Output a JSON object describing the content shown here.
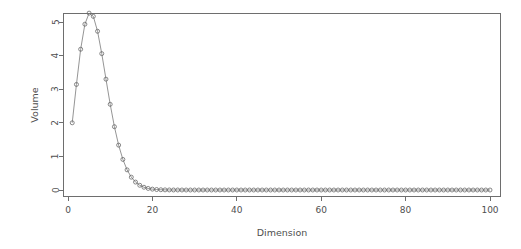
{
  "chart_data": {
    "type": "line",
    "title": "",
    "subtitle": "",
    "xlabel": "Dimension",
    "ylabel": "Volume",
    "grid": false,
    "legend": false,
    "legend_position": "none",
    "marker": "open-circle",
    "line_style": "solid",
    "xlim": [
      1,
      100
    ],
    "ylim": [
      0,
      5.2638
    ],
    "xticks": [
      0,
      20,
      40,
      60,
      80,
      100
    ],
    "xtick_labels": [
      "0",
      "20",
      "40",
      "60",
      "80",
      "100"
    ],
    "yticks": [
      0,
      1,
      2,
      3,
      4,
      5
    ],
    "ytick_labels": [
      "0",
      "1",
      "2",
      "3",
      "4",
      "5"
    ],
    "x": [
      1,
      2,
      3,
      4,
      5,
      6,
      7,
      8,
      9,
      10,
      11,
      12,
      13,
      14,
      15,
      16,
      17,
      18,
      19,
      20,
      21,
      22,
      23,
      24,
      25,
      26,
      27,
      28,
      29,
      30,
      31,
      32,
      33,
      34,
      35,
      36,
      37,
      38,
      39,
      40,
      41,
      42,
      43,
      44,
      45,
      46,
      47,
      48,
      49,
      50,
      51,
      52,
      53,
      54,
      55,
      56,
      57,
      58,
      59,
      60,
      61,
      62,
      63,
      64,
      65,
      66,
      67,
      68,
      69,
      70,
      71,
      72,
      73,
      74,
      75,
      76,
      77,
      78,
      79,
      80,
      81,
      82,
      83,
      84,
      85,
      86,
      87,
      88,
      89,
      90,
      91,
      92,
      93,
      94,
      95,
      96,
      97,
      98,
      99,
      100
    ],
    "values": [
      2.0,
      3.1416,
      4.1888,
      4.9348,
      5.2638,
      5.1677,
      4.7248,
      4.0587,
      3.2985,
      2.5502,
      1.8841,
      1.3353,
      0.9105,
      0.5993,
      0.3814,
      0.2353,
      0.1409,
      0.0821,
      0.0466,
      0.0258,
      0.014,
      0.0074,
      0.0038,
      0.0019,
      0.001,
      0.0005,
      0.0002,
      0.0001,
      5e-05,
      2e-05,
      1e-05,
      5e-06,
      2e-06,
      1e-06,
      4e-07,
      2e-07,
      7e-08,
      3e-08,
      1e-08,
      4e-09,
      1.5e-09,
      6e-10,
      2e-10,
      8e-11,
      3e-11,
      1e-11,
      4e-12,
      1.4e-12,
      5e-13,
      1.8e-13,
      6e-14,
      2e-14,
      7e-15,
      2e-15,
      8e-16,
      3e-16,
      9e-17,
      3e-17,
      1e-17,
      3e-18,
      1e-18,
      3e-19,
      1e-19,
      3e-20,
      1e-20,
      3e-21,
      9e-22,
      3e-22,
      8e-23,
      2e-23,
      7e-24,
      2e-24,
      6e-25,
      2e-25,
      5e-26,
      1e-26,
      4e-27,
      1e-27,
      3e-28,
      9e-29,
      2e-29,
      7e-30,
      2e-30,
      5e-31,
      1e-31,
      3e-32,
      1e-32,
      2e-33,
      6e-34,
      2e-34,
      4e-35,
      1e-35,
      3e-36,
      7e-37,
      2e-37,
      4e-38,
      1e-38,
      3e-39,
      6e-40,
      2e-40
    ],
    "colors": {
      "line": "#7a7a7a",
      "marker": "#6a6a6a",
      "axis": "#6e6e6e",
      "text": "#4f4f4f",
      "background": "#ffffff"
    }
  }
}
